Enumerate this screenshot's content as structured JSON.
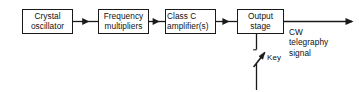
{
  "diagram": {
    "background_color": "#ffffff",
    "line_color": "#1a1a1a",
    "blocks": [
      {
        "id": "crystal-oscillator",
        "line1": "Crystal",
        "line2": "oscillator"
      },
      {
        "id": "frequency-multipliers",
        "line1": "Frequency",
        "line2": "multipliers"
      },
      {
        "id": "class-c-amplifier",
        "line1": "Class C",
        "line2": "amplifier(s)"
      },
      {
        "id": "output-stage",
        "line1": "Output",
        "line2": "stage"
      }
    ],
    "output_label": {
      "line1": "CW",
      "line2": "telegraphy",
      "line3": "signal"
    },
    "key_label": "Key",
    "connections": [
      {
        "from": "crystal-oscillator",
        "to": "frequency-multipliers",
        "direction": "right"
      },
      {
        "from": "frequency-multipliers",
        "to": "class-c-amplifier",
        "direction": "right"
      },
      {
        "from": "class-c-amplifier",
        "to": "output-stage",
        "direction": "right"
      },
      {
        "from": "output-stage",
        "to": "antenna-output",
        "direction": "right"
      },
      {
        "from": "output-stage",
        "to": "key",
        "direction": "down"
      }
    ]
  }
}
